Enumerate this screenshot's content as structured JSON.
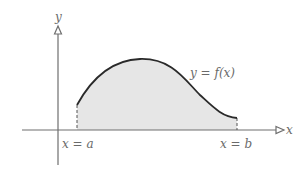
{
  "diagram": {
    "title": "",
    "axes": {
      "x_label": "x",
      "y_label": "y"
    },
    "curve_label": "y = f(x)",
    "bounds": {
      "left_label": "x = a",
      "right_label": "x = b"
    },
    "colors": {
      "axis": "#6e6e6e",
      "curve": "#2a2a2a",
      "fill": "#e6e6e6",
      "label": "#6a6a6a",
      "background": "#ffffff"
    }
  }
}
